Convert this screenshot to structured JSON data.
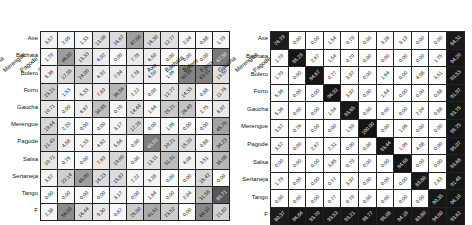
{
  "chart_data": [
    {
      "type": "heatmap",
      "title": "",
      "x_labels": [
        "Axe",
        "Bachata",
        "Bolero",
        "Forro",
        "Gaucha",
        "Merengue",
        "Pagode",
        "Salsa",
        "Sertaneja",
        "Tango",
        "Pr"
      ],
      "y_labels": [
        "Axe",
        "Bachata",
        "Bolero",
        "Forro",
        "Gaucha",
        "Merengue",
        "Pagode",
        "Salsa",
        "Sertaneja",
        "Tango",
        "F"
      ],
      "values": [
        [
          3.57,
          2.05,
          1.33,
          13.08,
          16.67,
          47.58,
          16.3,
          12.77,
          2.04,
          0.88,
          1.79
        ],
        [
          1.79,
          48.82,
          13.33,
          6.92,
          0.0,
          7.78,
          6.5,
          0.0,
          0.0,
          0.0,
          67.5
        ],
        [
          5.36,
          17.95,
          24.0,
          6.92,
          7.94,
          7.78,
          6.5,
          1.06,
          62.86,
          63.11,
          13.5
        ],
        [
          23.21,
          1.53,
          5.33,
          7.69,
          36.56,
          2.22,
          0.0,
          12.77,
          14.33,
          0.88,
          11.76
        ],
        [
          10.71,
          0.0,
          6.67,
          30.85,
          0.79,
          14.44,
          1.64,
          25.21,
          28.49,
          1.75,
          8.97
        ],
        [
          19.64,
          2.2,
          0.0,
          0.0,
          3.17,
          17.78,
          0.0,
          1.06,
          0.0,
          0.0,
          45.75
        ],
        [
          21.43,
          4.58,
          1.33,
          4.62,
          5.56,
          0.0,
          65.02,
          20.21,
          15.2,
          0.88,
          36.23
        ],
        [
          10.71,
          0.76,
          0.0,
          7.69,
          19.0,
          0.0,
          13.11,
          31.91,
          4.08,
          3.51,
          35.08
        ],
        [
          3.57,
          22.14,
          48.0,
          16.23,
          15.87,
          2.22,
          3.28,
          0.0,
          0.0,
          18.42,
          0.0
        ],
        [
          0.0,
          0.0,
          0.0,
          0.0,
          3.17,
          0.0,
          1.64,
          0.0,
          2.04,
          31.58,
          85.71
        ],
        [
          2.38,
          58.09,
          16.44,
          9.3,
          0.87,
          25.0,
          41.61,
          23.52,
          0.0,
          60.1,
          21.82
        ]
      ]
    },
    {
      "type": "heatmap",
      "title": "",
      "x_labels": [
        "Axe",
        "Bachata",
        "Bolero",
        "Forro",
        "Gaucha",
        "Merengue",
        "Pagode",
        "Salsa",
        "Sertaneja",
        "Tango",
        "Pr"
      ],
      "y_labels": [
        "Axe",
        "Bachata",
        "Bolero",
        "Forro",
        "Gaucha",
        "Merengue",
        "Pagode",
        "Salsa",
        "Sertaneja",
        "Tango",
        "F"
      ],
      "values": [
        [
          76.79,
          0.0,
          0.0,
          1.54,
          0.79,
          0.0,
          3.28,
          3.19,
          0.0,
          0.0,
          84.31
        ],
        [
          1.79,
          95.29,
          2.67,
          1.54,
          0.79,
          0.0,
          0.0,
          0.0,
          0.0,
          1.75,
          94.2
        ],
        [
          1.79,
          0.0,
          94.67,
          0.77,
          3.97,
          0.0,
          1.64,
          0.0,
          4.08,
          3.51,
          93.53
        ],
        [
          5.36,
          0.0,
          0.0,
          96.92,
          3.97,
          0.0,
          1.64,
          0.0,
          0.0,
          0.88,
          91.97
        ],
        [
          5.36,
          0.0,
          0.0,
          1.54,
          93.65,
          0.0,
          0.0,
          0.0,
          2.04,
          0.88,
          93.75
        ],
        [
          3.57,
          0.76,
          0.0,
          0.0,
          1.59,
          100.0,
          0.0,
          1.06,
          0.0,
          0.0,
          95.75
        ],
        [
          3.57,
          0.0,
          2.67,
          2.31,
          0.0,
          0.0,
          93.44,
          1.06,
          4.08,
          0.0,
          95.07
        ],
        [
          0.0,
          0.0,
          0.0,
          3.85,
          0.79,
          0.0,
          0.0,
          94.68,
          0.0,
          0.0,
          93.68
        ],
        [
          1.79,
          0.0,
          0.0,
          0.77,
          3.97,
          0.0,
          0.0,
          0.0,
          89.8,
          2.63,
          91.48
        ],
        [
          0.0,
          0.0,
          0.0,
          0.77,
          0.79,
          0.0,
          0.0,
          0.0,
          0.0,
          90.35,
          96.1
        ],
        [
          80.37,
          96.86,
          93.7,
          93.53,
          93.21,
          98.77,
          95.08,
          94.18,
          89.8,
          94.0,
          93.62
        ]
      ]
    }
  ]
}
